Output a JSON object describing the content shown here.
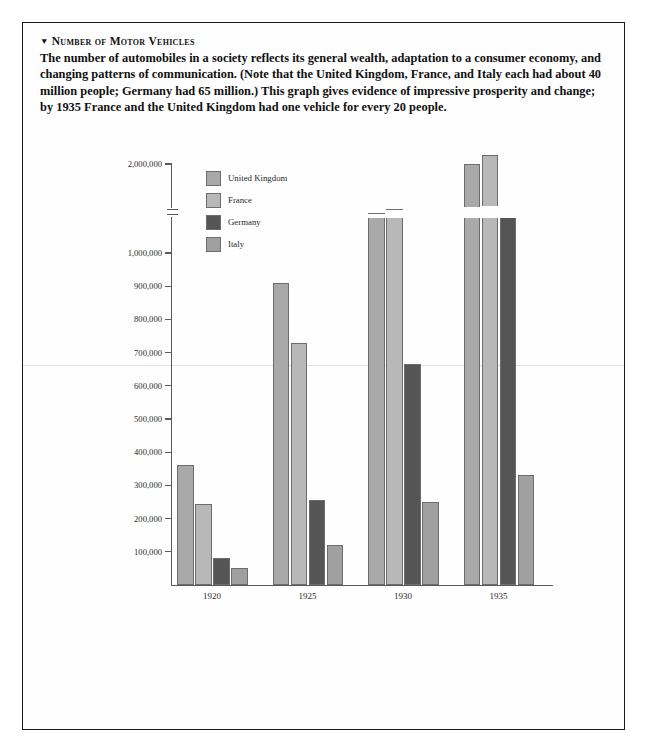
{
  "caption": {
    "marker": "▼",
    "title": "Number of Motor Vehicles",
    "body": "The number of automobiles in a society reflects its general wealth, adaptation to a consumer economy, and changing patterns of communication. (Note that the United Kingdom, France, and Italy each had about 40 million people; Germany had 65 million.) This graph gives evidence of impressive prosperity and change; by 1935 France and the United Kingdom had one vehicle for every 20 people."
  },
  "colors": {
    "united_kingdom": "#a9a9a9",
    "france": "#b8b8b8",
    "germany": "#555555",
    "italy": "#a0a0a0",
    "axis": "#5a5a5a",
    "border": "#1b1b1b",
    "background": "#fefefe"
  },
  "chart_data": {
    "type": "bar",
    "title": "Number of Motor Vehicles",
    "xlabel": "",
    "ylabel": "",
    "grid": false,
    "legend_position": "upper-left-inside",
    "axis_break": {
      "present": true,
      "below": 1000000,
      "above": 2000000,
      "note": "y-axis compressed between 1,000,000 and 2,000,000"
    },
    "ylim": [
      0,
      2200000
    ],
    "yticks": [
      100000,
      200000,
      300000,
      400000,
      500000,
      600000,
      700000,
      800000,
      900000,
      1000000,
      2000000
    ],
    "ytick_labels": [
      "100,000",
      "200,000",
      "300,000",
      "400,000",
      "500,000",
      "600,000",
      "700,000",
      "800,000",
      "900,000",
      "1,000,000",
      "2,000,000"
    ],
    "categories": [
      "1920",
      "1925",
      "1930",
      "1935"
    ],
    "series": [
      {
        "name": "United Kingdom",
        "color": "#a9a9a9",
        "values": [
          360000,
          910000,
          1450000,
          2000000
        ]
      },
      {
        "name": "France",
        "color": "#b8b8b8",
        "values": [
          245000,
          730000,
          1500000,
          2100000
        ]
      },
      {
        "name": "Germany",
        "color": "#555555",
        "values": [
          80000,
          255000,
          665000,
          1120000
        ]
      },
      {
        "name": "Italy",
        "color": "#a0a0a0",
        "values": [
          50000,
          120000,
          250000,
          330000
        ]
      }
    ]
  }
}
